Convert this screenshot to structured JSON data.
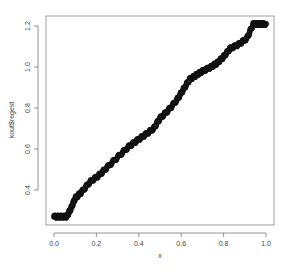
{
  "chart_data": {
    "type": "scatter",
    "title": "",
    "xlabel": "x",
    "ylabel": "kout$regest",
    "xlim": [
      -0.04,
      1.04
    ],
    "ylim": [
      0.22,
      1.24
    ],
    "x_ticks": [
      0.0,
      0.2,
      0.4,
      0.6,
      0.8,
      1.0
    ],
    "x_tick_labels": [
      "0.0",
      "0.2",
      "0.4",
      "0.6",
      "0.8",
      "1.0"
    ],
    "y_ticks": [
      0.4,
      0.6,
      0.8,
      1.0,
      1.2
    ],
    "y_tick_labels": [
      "0.4",
      "0.6",
      "0.8",
      "1.0",
      "1.2"
    ],
    "grid": false,
    "legend": null,
    "series": [
      {
        "name": "kout$regest",
        "color": "#111111",
        "marker": "circle",
        "x": [
          0.0,
          0.03,
          0.06,
          0.08,
          0.1,
          0.13,
          0.17,
          0.21,
          0.25,
          0.3,
          0.35,
          0.39,
          0.43,
          0.47,
          0.5,
          0.54,
          0.58,
          0.61,
          0.64,
          0.67,
          0.7,
          0.74,
          0.77,
          0.8,
          0.83,
          0.87,
          0.91,
          0.94,
          0.97,
          1.0
        ],
        "y": [
          0.27,
          0.27,
          0.27,
          0.31,
          0.36,
          0.39,
          0.44,
          0.47,
          0.51,
          0.56,
          0.61,
          0.64,
          0.67,
          0.7,
          0.75,
          0.79,
          0.84,
          0.89,
          0.94,
          0.96,
          0.98,
          1.0,
          1.02,
          1.05,
          1.09,
          1.11,
          1.14,
          1.21,
          1.21,
          1.21
        ]
      }
    ]
  }
}
